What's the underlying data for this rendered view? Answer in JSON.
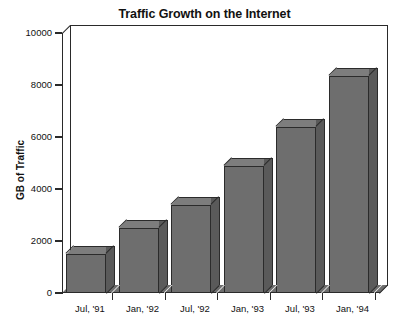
{
  "chart_data": {
    "type": "bar",
    "title": "Traffic Growth on the Internet",
    "xlabel": "",
    "ylabel": "GB of Traffic",
    "categories": [
      "Jul, '91",
      "Jan, '92",
      "Jul, '92",
      "Jan, '93",
      "Jul, '93",
      "Jan, '94"
    ],
    "values": [
      1500,
      2500,
      3400,
      4900,
      6400,
      8350
    ],
    "ylim": [
      0,
      10000
    ],
    "yticks": [
      0,
      2000,
      4000,
      6000,
      8000,
      10000
    ],
    "ytick_labels": [
      "0",
      "2000",
      "4000",
      "6000",
      "8000",
      "10000"
    ],
    "grid": false,
    "legend": null,
    "style": {
      "bar_face_color": "#6e6e6e",
      "bar_side_color": "#5a5a5a",
      "bar_top_color": "#7d7d7d",
      "bar_edge_color": "#2b2b2b",
      "axis_color": "#2a2a2a",
      "background_color": "#ffffff",
      "three_d": true
    }
  },
  "figure": {
    "title": "Traffic Growth on the Internet",
    "y_axis_title": "GB of Traffic"
  }
}
